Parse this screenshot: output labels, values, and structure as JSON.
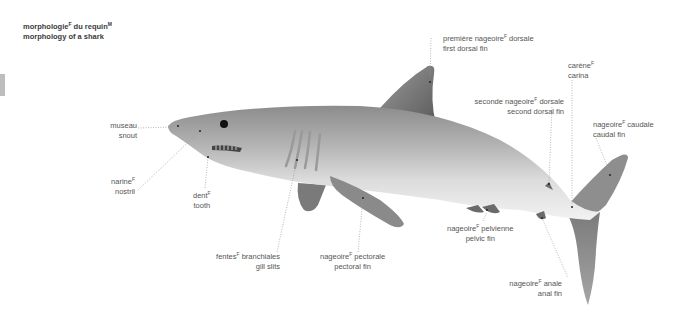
{
  "title": {
    "fr": "morphologie",
    "fr_gender": "F",
    "fr_rest": " du requin",
    "fr_rest_gender": "M",
    "en": "morphology of a shark"
  },
  "labels": {
    "first_dorsal_fin": {
      "fr": "première nageoire",
      "gender": "F",
      "fr_rest": " dorsale",
      "en": "first dorsal fin"
    },
    "carina": {
      "fr": "carène",
      "gender": "F",
      "fr_rest": "",
      "en": "carina"
    },
    "second_dorsal_fin": {
      "fr": "seconde nageoire",
      "gender": "F",
      "fr_rest": " dorsale",
      "en": "second dorsal fin"
    },
    "caudal_fin": {
      "fr": "nageoire",
      "gender": "F",
      "fr_rest": " caudale",
      "en": "caudal fin"
    },
    "snout": {
      "fr": "museau",
      "gender": "",
      "fr_rest": "",
      "en": "snout"
    },
    "nostril": {
      "fr": "narine",
      "gender": "F",
      "fr_rest": "",
      "en": "nostril"
    },
    "tooth": {
      "fr": "dent",
      "gender": "F",
      "fr_rest": "",
      "en": "tooth"
    },
    "gill_slits": {
      "fr": "fentes",
      "gender": "F",
      "fr_rest": " branchiales",
      "en": "gill slits"
    },
    "pectoral_fin": {
      "fr": "nageoire",
      "gender": "F",
      "fr_rest": " pectorale",
      "en": "pectoral fin"
    },
    "pelvic_fin": {
      "fr": "nageoire",
      "gender": "F",
      "fr_rest": " pelvienne",
      "en": "pelvic fin"
    },
    "anal_fin": {
      "fr": "nageoire",
      "gender": "F",
      "fr_rest": " anale",
      "en": "anal fin"
    }
  },
  "colors": {
    "background": "#ffffff",
    "shark_back": "#8a8a8a",
    "shark_belly": "#eeeeee",
    "leader_line": "#9a9a9a",
    "side_tab": "#bdbdbd"
  }
}
